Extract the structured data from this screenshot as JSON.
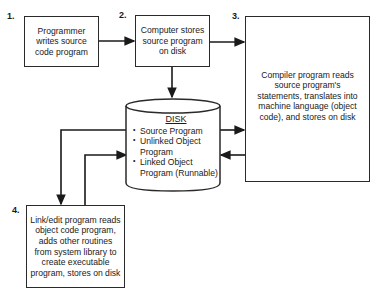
{
  "diagram": {
    "steps": [
      {
        "number": "1.",
        "text": "Programmer writes source code program"
      },
      {
        "number": "2.",
        "text": "Computer stores source program on disk"
      },
      {
        "number": "3.",
        "text": "Compiler program reads source program's statements, translates into machine language (object code), and stores on disk"
      },
      {
        "number": "4.",
        "text": "Link/edit program reads object code program, adds other routines from system library to create executable program, stores on disk"
      }
    ],
    "disk": {
      "title": "DISK",
      "items": [
        {
          "bullet": "•",
          "text": "Source Program"
        },
        {
          "bullet": "•",
          "text": "Unlinked Object Program"
        },
        {
          "bullet": "•",
          "text": "Linked Object Program (Runnable)"
        }
      ]
    },
    "connections": [
      {
        "from": "1",
        "to": "2"
      },
      {
        "from": "2",
        "to": "3"
      },
      {
        "from": "2",
        "to": "disk"
      },
      {
        "from": "disk",
        "to": "3"
      },
      {
        "from": "3",
        "to": "disk"
      },
      {
        "from": "disk",
        "to": "4"
      },
      {
        "from": "4",
        "to": "disk"
      }
    ]
  }
}
